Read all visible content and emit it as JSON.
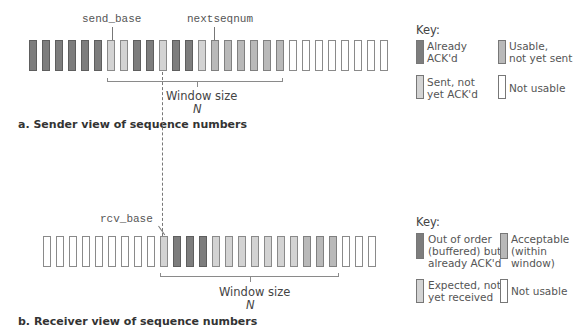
{
  "colors": {
    "already_acked": "#7d7d7d",
    "sent_not_acked": "#d3d3d3",
    "usable_not_sent": "#b9b9b9",
    "not_usable": "#ffffff"
  },
  "sender": {
    "send_base_label": "send_base",
    "nextseqnum_label": "nextseqnum",
    "window_label": "Window size",
    "window_n": "N",
    "subtitle": "a. Sender view of sequence numbers",
    "boxes": [
      "dark",
      "dark",
      "dark",
      "dark",
      "dark",
      "dark",
      "light",
      "light",
      "dark",
      "dark",
      "light",
      "dark",
      "dark",
      "light",
      "medium",
      "medium",
      "medium",
      "medium",
      "medium",
      "medium",
      "white",
      "white",
      "white",
      "white",
      "white",
      "white",
      "white",
      "white"
    ],
    "key": {
      "title": "Key:",
      "items": [
        {
          "label": "Already\nACK'd",
          "color": "dark"
        },
        {
          "label": "Usable,\nnot yet sent",
          "color": "medium"
        },
        {
          "label": "Sent, not\nyet ACK'd",
          "color": "light"
        },
        {
          "label": "Not usable",
          "color": "white"
        }
      ]
    }
  },
  "receiver": {
    "rcv_base_label": "rcv_base",
    "window_label": "Window size",
    "window_n": "N",
    "subtitle": "b. Receiver view of sequence numbers",
    "boxes": [
      "white",
      "white",
      "white",
      "white",
      "white",
      "white",
      "white",
      "white",
      "white",
      "light",
      "dark",
      "dark",
      "dark",
      "light",
      "light",
      "light",
      "light",
      "light",
      "light",
      "light",
      "medium",
      "medium",
      "medium",
      "white",
      "white",
      "white"
    ],
    "key": {
      "title": "Key:",
      "items": [
        {
          "label": "Out of order\n(buffered) but\nalready ACK'd",
          "color": "dark"
        },
        {
          "label": "Acceptable\n(within\nwindow)",
          "color": "medium"
        },
        {
          "label": "Expected, not\nyet received",
          "color": "light"
        },
        {
          "label": "Not usable",
          "color": "white"
        }
      ]
    }
  }
}
